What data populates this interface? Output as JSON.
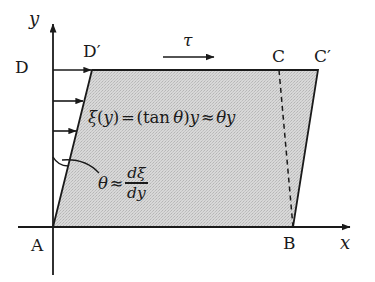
{
  "figure": {
    "type": "geometry-diagram",
    "background_color": "#ffffff",
    "ink_color": "#1a1a1a",
    "fill_color": "#d2d2d2",
    "axes": {
      "x_label": "x",
      "y_label": "y",
      "origin_label": "A"
    },
    "vertex_labels": {
      "a": "A",
      "b": "B",
      "c": "C",
      "c_prime": "C′",
      "d": "D",
      "d_prime": "D′"
    },
    "shear_stress_label": "τ",
    "displacement_equation": {
      "lhs_symbol": "ξ",
      "full_text": "ξ(y) = (tan θ)y ≈ θy",
      "parts": {
        "xi": "ξ",
        "open_arg": "(",
        "arg": "y",
        "close_arg": ")",
        "equals": "=",
        "open_paren": "(",
        "tan": "tan",
        "theta": "θ",
        "close_paren": ")",
        "y_factor": "y",
        "approx": "≈",
        "theta2": "θ",
        "y2": "y"
      }
    },
    "angle_equation": {
      "full_text": "θ ≈ dξ/dy",
      "parts": {
        "theta": "θ",
        "approx": "≈",
        "numerator": "dξ",
        "denominator": "dy"
      }
    },
    "geometry": {
      "origin_px": [
        53,
        227
      ],
      "top_left_px": [
        92,
        70
      ],
      "top_right_px": [
        318,
        70
      ],
      "bottom_right_px": [
        293,
        227
      ],
      "dashed_top_px": [
        279,
        70
      ],
      "arrow_rows_y": [
        70,
        101,
        131
      ],
      "arrow_start_x": 53,
      "tau_arrow": [
        163,
        57,
        214,
        57
      ]
    }
  }
}
